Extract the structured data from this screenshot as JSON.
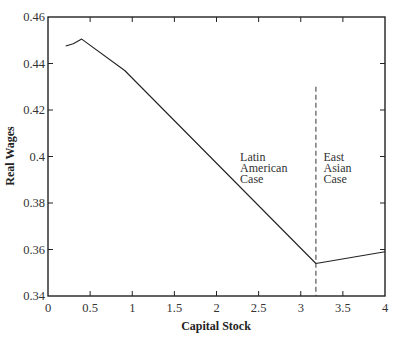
{
  "chart_data": {
    "type": "line",
    "title": "",
    "xlabel": "Capital Stock",
    "ylabel": "Real Wages",
    "xlim": [
      0,
      4
    ],
    "ylim": [
      0.34,
      0.46
    ],
    "grid": false,
    "legend": null,
    "x_ticks": [
      "0",
      "0.5",
      "1",
      "1.5",
      "2",
      "2.5",
      "3",
      "3.5",
      "4"
    ],
    "y_ticks": [
      "0.34",
      "0.36",
      "0.38",
      "0.4",
      "0.42",
      "0.44",
      "0.46"
    ],
    "series": [
      {
        "name": "Real Wages",
        "x": [
          0.21,
          0.3,
          0.4,
          0.91,
          3.18,
          4.0
        ],
        "y": [
          0.4475,
          0.4485,
          0.4505,
          0.437,
          0.354,
          0.359
        ]
      }
    ],
    "vertical_line": {
      "x": 3.18,
      "style": "dashed",
      "y_top": 0.43
    },
    "annotations": [
      {
        "text": [
          "Latin",
          "American",
          "Case"
        ],
        "x": 2.28,
        "y": 0.398
      },
      {
        "text": [
          "East",
          "Asian",
          "Case"
        ],
        "x": 3.27,
        "y": 0.398
      }
    ]
  }
}
